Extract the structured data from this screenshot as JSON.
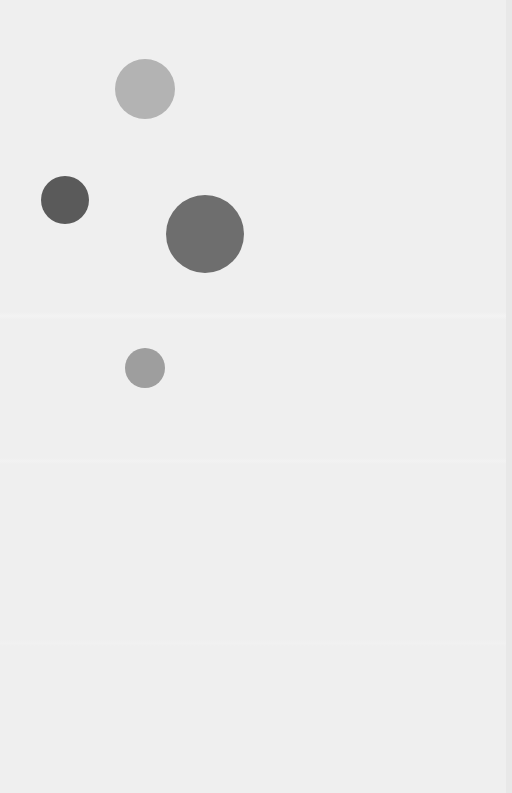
{
  "canvas": {
    "width": 512,
    "height": 793,
    "background": "#efefef"
  },
  "circles": [
    {
      "id": "circle-top-light",
      "cx": 145,
      "cy": 89,
      "r": 30,
      "color": "#b3b3b3"
    },
    {
      "id": "circle-left-dark",
      "cx": 65,
      "cy": 200,
      "r": 24,
      "color": "#5a5a5a"
    },
    {
      "id": "circle-large-medium",
      "cx": 205,
      "cy": 234,
      "r": 39,
      "color": "#6e6e6e"
    },
    {
      "id": "circle-small-bottom",
      "cx": 145,
      "cy": 368,
      "r": 20,
      "color": "#9e9e9e"
    }
  ]
}
